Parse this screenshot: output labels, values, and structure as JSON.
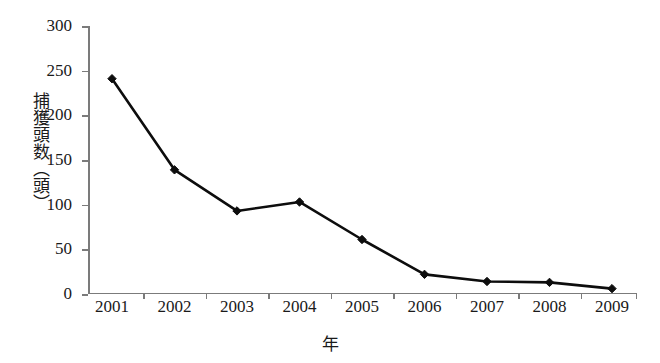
{
  "chart_data": {
    "type": "line",
    "title": "",
    "xlabel": "年",
    "ylabel": "捕獲頭数（頭）",
    "categories": [
      "2001",
      "2002",
      "2003",
      "2004",
      "2005",
      "2006",
      "2007",
      "2008",
      "2009"
    ],
    "x": [
      2001,
      2002,
      2003,
      2004,
      2005,
      2006,
      2007,
      2008,
      2009
    ],
    "series": [
      {
        "name": "捕獲頭数",
        "values": [
          241,
          139,
          93,
          103,
          61,
          22,
          14,
          13,
          6
        ],
        "color": "#0d0d0d",
        "marker": "diamond"
      }
    ],
    "ylim": [
      0,
      300
    ],
    "ytick_values": [
      0,
      50,
      100,
      150,
      200,
      250,
      300
    ],
    "ytick_labels": [
      "0",
      "50",
      "100",
      "150",
      "200",
      "250",
      "300"
    ],
    "xtick_labels": [
      "2001",
      "2002",
      "2003",
      "2004",
      "2005",
      "2006",
      "2007",
      "2008",
      "2009"
    ],
    "grid": false,
    "legend": false,
    "legend_position": "none",
    "axis_color": "#7b7b7b",
    "background": "#ffffff"
  },
  "axis": {
    "y_title": "捕獲頭数（頭）",
    "x_title": "年"
  }
}
